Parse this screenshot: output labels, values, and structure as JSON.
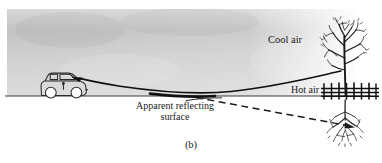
{
  "figure": {
    "panel_letter": "(b)",
    "labels": {
      "cool_air": "Cool air",
      "hot_air": "Hot air",
      "apparent_surface": "Apparent reflecting surface"
    },
    "colors": {
      "ink": "#191919",
      "sky_gray_top": "#bdbdbd",
      "sky_gray_bottom": "#d6d6d6",
      "paper": "#ffffff",
      "ground_line": "#3c3c3c"
    },
    "scene": {
      "ground_line_y": 96,
      "sky_region": {
        "x": 7,
        "y": 9,
        "width": 347,
        "height": 87
      },
      "observer": "car",
      "object": "tree",
      "inverted_image": "inverted-tree-mirage",
      "fence": "horizontal-fence",
      "ray_type": "curved-refracted-light-ray",
      "sight_line_type": "dashed-apparent-ray"
    }
  }
}
